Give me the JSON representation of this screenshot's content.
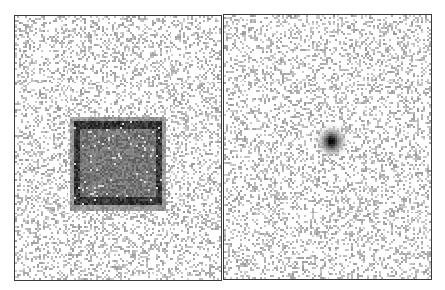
{
  "figure": {
    "colors": {
      "border": "#3a3a3a",
      "background": "#ffffff",
      "noise": "#b8b8b8",
      "feature_dark": "#2a2a2a"
    },
    "panels": [
      {
        "name": "left",
        "content": "square",
        "noise_density": 0.32,
        "feature": {
          "shape": "square",
          "center_frac": [
            0.495,
            0.555
          ],
          "size_frac": [
            0.42,
            0.315
          ],
          "intensity": 0.55,
          "edge_darkening": 0.25
        }
      },
      {
        "name": "right",
        "content": "point",
        "noise_density": 0.32,
        "feature": {
          "shape": "gaussian-blob",
          "center_frac": [
            0.515,
            0.475
          ],
          "sigma_frac": 0.03,
          "intensity": 0.95
        }
      }
    ]
  }
}
